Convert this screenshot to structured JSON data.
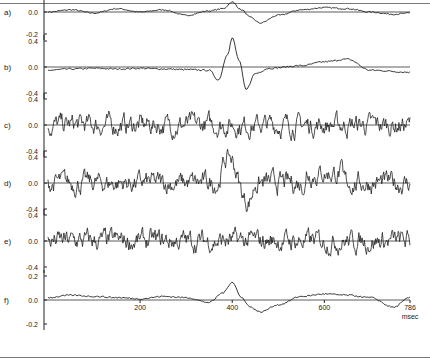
{
  "chart_data": {
    "type": "line",
    "title": "",
    "xlabel": "msec",
    "x_unit": "msec",
    "x_range": [
      0,
      786
    ],
    "x_ticks": [
      200,
      400,
      600,
      786
    ],
    "panels": [
      {
        "label": "a)",
        "yticks": [
          "0.2",
          "0.0",
          "-0.2"
        ],
        "ylim": [
          -0.25,
          0.25
        ],
        "description": "averaged difference wave, small positive peak ~400 ms, negative dip ~440 ms",
        "x": [
          0,
          50,
          100,
          150,
          200,
          250,
          300,
          350,
          380,
          400,
          420,
          440,
          460,
          500,
          550,
          600,
          650,
          700,
          750,
          786
        ],
        "values": [
          0.0,
          0.02,
          -0.01,
          0.03,
          0.0,
          0.02,
          -0.03,
          0.01,
          0.03,
          0.09,
          0.02,
          -0.05,
          -0.1,
          -0.03,
          0.02,
          0.04,
          0.03,
          0.0,
          -0.02,
          -0.01
        ]
      },
      {
        "label": "b)",
        "yticks": [
          "0.4",
          "0.0",
          "-0.4"
        ],
        "ylim": [
          -0.5,
          0.5
        ],
        "description": "large biphasic deflection ~400 ms (+0.45 peak, -0.35 trough), slow positive drift ~600 ms",
        "x": [
          0,
          50,
          100,
          150,
          200,
          250,
          300,
          350,
          370,
          390,
          400,
          415,
          430,
          450,
          480,
          550,
          600,
          650,
          700,
          786
        ],
        "values": [
          -0.05,
          -0.03,
          -0.02,
          -0.03,
          -0.02,
          -0.03,
          -0.04,
          -0.05,
          -0.2,
          0.2,
          0.45,
          0.1,
          -0.35,
          -0.1,
          -0.02,
          0.02,
          0.08,
          0.12,
          -0.05,
          -0.08
        ]
      },
      {
        "label": "c)",
        "yticks": [
          "0.4",
          "0.0",
          "-0.4"
        ],
        "ylim": [
          -0.5,
          0.5
        ],
        "description": "noisy single trial, amplitude ~±0.3, no clear response"
      },
      {
        "label": "d)",
        "yticks": [
          "0.4",
          "0.0",
          "-0.4"
        ],
        "ylim": [
          -0.5,
          0.5
        ],
        "description": "noisy single trial with positive deflection ~400 ms (+0.45) followed by negative (-0.35) ~430 ms"
      },
      {
        "label": "e)",
        "yticks": [
          "0.4",
          "0.0",
          "-0.4"
        ],
        "ylim": [
          -0.5,
          0.5
        ],
        "description": "noisy single trial, amplitude ~±0.35"
      },
      {
        "label": "f)",
        "yticks": [
          "0.2",
          "0.0",
          "-0.2"
        ],
        "ylim": [
          -0.25,
          0.25
        ],
        "description": "averaged wave with small peak (~0.15) near 400 ms and dip near 440 ms",
        "x": [
          0,
          50,
          100,
          150,
          200,
          250,
          300,
          350,
          380,
          400,
          420,
          440,
          460,
          500,
          550,
          600,
          650,
          700,
          750,
          786
        ],
        "values": [
          0.02,
          0.04,
          0.03,
          0.02,
          0.01,
          0.03,
          0.02,
          -0.02,
          0.06,
          0.15,
          0.02,
          -0.06,
          -0.1,
          -0.04,
          0.03,
          0.05,
          0.04,
          0.02,
          -0.06,
          0.02
        ]
      }
    ],
    "grid": false,
    "legend": null
  },
  "axis": {
    "x_tick_labels": [
      "200",
      "400",
      "600",
      "786"
    ],
    "x_unit_label": "msec"
  },
  "panels": [
    {
      "label": "a)",
      "ticks": [
        "0.2",
        "0.0",
        "-0.2"
      ]
    },
    {
      "label": "b)",
      "ticks": [
        "0.4",
        "0.0",
        "-0.4"
      ]
    },
    {
      "label": "c)",
      "ticks": [
        "0.4",
        "0.0",
        "-0.4"
      ]
    },
    {
      "label": "d)",
      "ticks": [
        "0.4",
        "0.0",
        "-0.4"
      ]
    },
    {
      "label": "e)",
      "ticks": [
        "0.4",
        "0.0",
        "-0.4"
      ]
    },
    {
      "label": "f)",
      "ticks": [
        "0.2",
        "0.0",
        "-0.2"
      ]
    }
  ],
  "colors": {
    "trace": "#222222",
    "baseline": "#333333",
    "frame": "#777777"
  }
}
